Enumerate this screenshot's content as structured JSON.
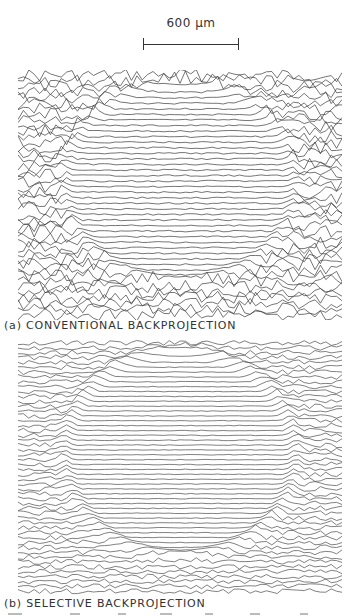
{
  "figure": {
    "scale_bar": {
      "label": "600 μm",
      "length_px": 96
    },
    "panels": [
      {
        "id": "a",
        "caption": "(a) CONVENTIONAL BACKPROJECTION",
        "line_count": 44,
        "line_color": "#3a3a3a",
        "noise_outside": 6.5,
        "noise_inside": 0.8,
        "circle": {
          "cx": 0.5,
          "cy": 0.45,
          "rx": 0.36,
          "ry": 0.4
        },
        "rim_amplitude": 5
      },
      {
        "id": "b",
        "caption": "(b) SELECTIVE BACKPROJECTION",
        "line_count": 52,
        "line_color": "#4a4a4a",
        "noise_outside": 2.5,
        "noise_inside": 0.4,
        "circle": {
          "cx": 0.5,
          "cy": 0.45,
          "rx": 0.36,
          "ry": 0.4
        },
        "rim_amplitude": 6
      }
    ],
    "footer_fragment": "partially visible text line (cut off)"
  }
}
